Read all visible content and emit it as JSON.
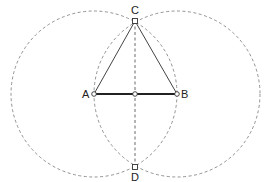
{
  "diagram": {
    "points": {
      "A": {
        "label": "A",
        "x": 94,
        "y": 94
      },
      "B": {
        "label": "B",
        "x": 177,
        "y": 94
      },
      "C": {
        "label": "C",
        "x": 135,
        "y": 21
      },
      "D": {
        "label": "D",
        "x": 135,
        "y": 167
      },
      "M": {
        "label": "",
        "x": 135,
        "y": 94
      }
    },
    "circles": [
      {
        "center": "A",
        "radius": 83
      },
      {
        "center": "B",
        "radius": 83
      }
    ],
    "colors": {
      "line": "#333333",
      "dashed": "#777777",
      "background": "#ffffff"
    }
  }
}
